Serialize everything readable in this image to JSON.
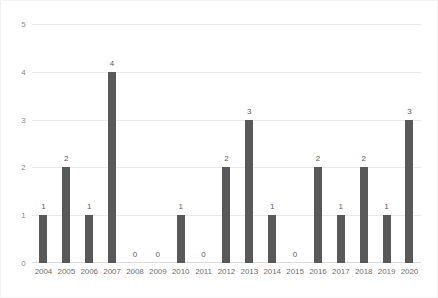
{
  "chart_data": {
    "type": "bar",
    "title": "",
    "xlabel": "",
    "ylabel": "",
    "ylim": [
      0,
      5
    ],
    "y_ticks": [
      0,
      1,
      2,
      3,
      4,
      5
    ],
    "grid": true,
    "legend": "none",
    "bar_color": "#595959",
    "gridline_color": "#e9e9e9",
    "label_color": "#5b5b5b",
    "categories": [
      "2004",
      "2005",
      "2006",
      "2007",
      "2008",
      "2009",
      "2010",
      "2011",
      "2012",
      "2013",
      "2014",
      "2015",
      "2016",
      "2017",
      "2018",
      "2019",
      "2020"
    ],
    "values": [
      1,
      2,
      1,
      4,
      0,
      0,
      1,
      0,
      2,
      3,
      1,
      0,
      2,
      1,
      2,
      1,
      3
    ],
    "data_labels": [
      "1",
      "2",
      "1",
      "4",
      "0",
      "0",
      "1",
      "0",
      "2",
      "3",
      "1",
      "0",
      "2",
      "1",
      "2",
      "1",
      "3"
    ]
  }
}
